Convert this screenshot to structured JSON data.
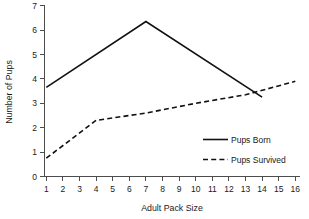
{
  "chart_data": {
    "type": "line",
    "title": "",
    "xlabel": "Adult Pack Size",
    "ylabel": "Number of Pups",
    "xlim": [
      0.2,
      16.8
    ],
    "ylim": [
      0,
      7
    ],
    "grid": false,
    "legend_position": "lower-right-inside",
    "x_ticks": [
      "1",
      "2",
      "3",
      "4",
      "5",
      "6",
      "7",
      "8",
      "9",
      "10",
      "11",
      "12",
      "13",
      "14",
      "15",
      "16"
    ],
    "x_tick_values": [
      1,
      2,
      3,
      4,
      5,
      6,
      7,
      8,
      9,
      10,
      11,
      12,
      13,
      14,
      15,
      16
    ],
    "y_ticks": [
      "0",
      "1",
      "2",
      "3",
      "4",
      "5",
      "6",
      "7"
    ],
    "y_tick_values": [
      0,
      1,
      2,
      3,
      4,
      5,
      6,
      7
    ],
    "series": [
      {
        "name": "Pups Born",
        "style": "solid",
        "color": "#111111",
        "x": [
          1,
          7,
          14
        ],
        "values": [
          3.65,
          6.35,
          3.25
        ]
      },
      {
        "name": "Pups Survived",
        "style": "dashed",
        "color": "#111111",
        "x": [
          1,
          4,
          5,
          7,
          10,
          13,
          16
        ],
        "values": [
          0.75,
          2.3,
          2.4,
          2.6,
          3.0,
          3.35,
          3.9
        ]
      }
    ]
  },
  "legend": {
    "items": [
      {
        "label": "Pups Born",
        "style": "solid"
      },
      {
        "label": "Pups Survived",
        "style": "dashed"
      }
    ]
  },
  "axes": {
    "x_title": "Adult Pack Size",
    "y_title": "Number of Pups"
  }
}
